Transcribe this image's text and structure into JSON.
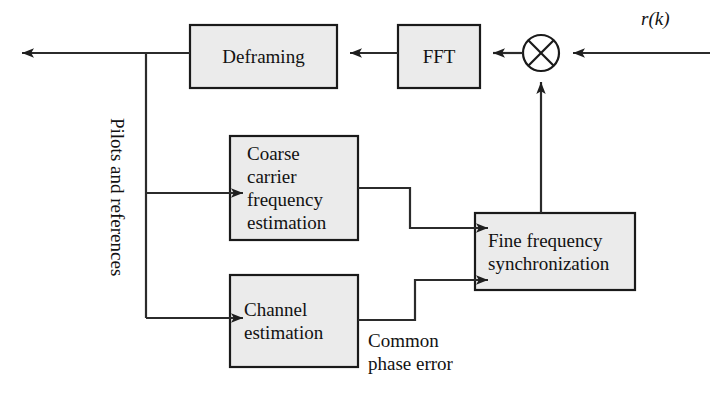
{
  "diagram": {
    "type": "block-diagram",
    "width": 712,
    "height": 395,
    "colors": {
      "background": "#ffffff",
      "box_fill": "#ebebeb",
      "box_stroke": "#1a1a1a",
      "line": "#2b2b2b",
      "text": "#121212"
    },
    "blocks": [
      {
        "id": "deframing",
        "label": "Deframing",
        "x": 190,
        "y": 25,
        "width": 147,
        "height": 63,
        "align": "center"
      },
      {
        "id": "fft",
        "label": "FFT",
        "x": 398,
        "y": 25,
        "width": 82,
        "height": 63,
        "align": "center"
      },
      {
        "id": "coarse-carrier-frequency-estimation",
        "label": "Coarse\ncarrier\nfrequency\nestimation",
        "x": 230,
        "y": 136,
        "width": 128,
        "height": 104,
        "align": "left"
      },
      {
        "id": "channel-estimation",
        "label": "Channel\nestimation",
        "x": 230,
        "y": 275,
        "width": 128,
        "height": 92,
        "align": "left"
      },
      {
        "id": "fine-frequency-synchronization",
        "label": "Fine frequency\nsynchronization",
        "x": 475,
        "y": 213,
        "width": 160,
        "height": 77,
        "align": "left"
      }
    ],
    "multiplier": {
      "id": "multiplier",
      "symbol": "cross-in-circle",
      "cx": 541,
      "cy": 53,
      "r": 18
    },
    "labels": [
      {
        "id": "pilots-and-references",
        "text": "Pilots and references",
        "x": 128,
        "y": 118,
        "rotated": true
      },
      {
        "id": "common-phase-error",
        "text": "Common\nphase error",
        "x": 368,
        "y": 329,
        "rotated": false
      }
    ],
    "signals": [
      {
        "id": "input-signal",
        "text": "r(k)",
        "x": 641,
        "y": 8
      }
    ],
    "connections": [
      {
        "id": "input-to-multiplier",
        "from": "r(k) input",
        "to": "multiplier",
        "arrow": "left"
      },
      {
        "id": "multiplier-to-fft",
        "from": "multiplier",
        "to": "fft",
        "arrow": "left"
      },
      {
        "id": "fft-to-deframing",
        "from": "fft",
        "to": "deframing",
        "arrow": "left"
      },
      {
        "id": "deframing-to-output",
        "from": "deframing",
        "to": "output",
        "arrow": "left"
      },
      {
        "id": "tap-to-coarse",
        "from": "deframing output tap",
        "to": "coarse-carrier-frequency-estimation",
        "arrow": "right"
      },
      {
        "id": "tap-to-channel",
        "from": "deframing output tap",
        "to": "channel-estimation",
        "arrow": "right"
      },
      {
        "id": "coarse-to-fine",
        "from": "coarse-carrier-frequency-estimation",
        "to": "fine-frequency-synchronization",
        "arrow": "right"
      },
      {
        "id": "channel-to-fine",
        "from": "channel-estimation",
        "to": "fine-frequency-synchronization",
        "arrow": "right"
      },
      {
        "id": "fine-to-multiplier",
        "from": "fine-frequency-synchronization",
        "to": "multiplier",
        "arrow": "up"
      }
    ]
  }
}
